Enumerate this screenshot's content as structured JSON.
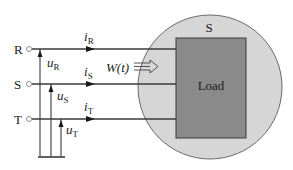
{
  "diagram": {
    "type": "three-phase circuit with load",
    "system_label": "S",
    "load_label": "Load",
    "power_label": "W(t)",
    "phases": [
      {
        "terminal": "R",
        "current": {
          "sym": "i",
          "sub": "R"
        },
        "voltage": {
          "sym": "u",
          "sub": "R"
        }
      },
      {
        "terminal": "S",
        "current": {
          "sym": "i",
          "sub": "S"
        },
        "voltage": {
          "sym": "u",
          "sub": "S"
        }
      },
      {
        "terminal": "T",
        "current": {
          "sym": "i",
          "sub": "T"
        },
        "voltage": {
          "sym": "u",
          "sub": "T"
        }
      }
    ],
    "colors": {
      "line": "#3a3a3a",
      "circle_fill": "#d6d6d6",
      "circle_stroke": "#6a6a6a",
      "load_fill": "#8a8a8a",
      "load_stroke": "#3a3a3a",
      "text": "#1a1a1a"
    }
  }
}
